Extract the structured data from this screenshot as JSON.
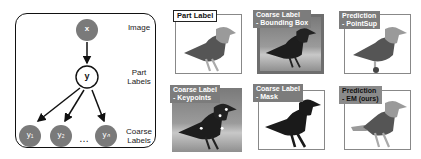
{
  "diagram": {
    "nodes": {
      "x": "x",
      "y": "y",
      "y1": "y₁",
      "y2": "y₂",
      "yn": "yₙ",
      "ellipsis": "…"
    },
    "row_labels": {
      "image": "Image",
      "part_line1": "Part",
      "part_line2": "Labels",
      "coarse_line1": "Coarse",
      "coarse_line2": "Labels"
    },
    "colors": {
      "observed_node": "#7a7a7a",
      "latent_node": "#ffffff",
      "edge": "#111111"
    }
  },
  "panels": [
    {
      "id": "part-label",
      "line1": "Part Label",
      "line2": ""
    },
    {
      "id": "coarse-bbox",
      "line1": "Coarse Label",
      "line2": "- Bounding Box"
    },
    {
      "id": "pred-pointsup",
      "line1": "Prediction",
      "line2": "- PointSup"
    },
    {
      "id": "coarse-keypoints",
      "line1": "Coarse Label",
      "line2": "- Keypoints"
    },
    {
      "id": "coarse-mask",
      "line1": "Coarse Label",
      "line2": "- Mask"
    },
    {
      "id": "pred-em",
      "line1": "Prediction",
      "line2": "- EM (ours)"
    }
  ]
}
